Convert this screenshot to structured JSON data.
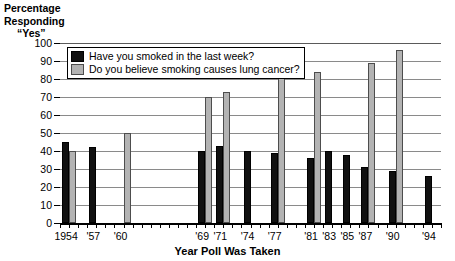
{
  "chart_data": {
    "type": "bar",
    "title": "",
    "ylabel": "Percentage Responding \"Yes\"",
    "ylabel_lines": [
      "Percentage",
      "Responding",
      "“Yes”"
    ],
    "xlabel": "Year Poll Was Taken",
    "ylim": [
      0,
      100
    ],
    "ytick_labels": [
      "0",
      "10",
      "20",
      "30",
      "40",
      "50",
      "60",
      "70",
      "80",
      "90",
      "100"
    ],
    "ytick_values": [
      0,
      10,
      20,
      30,
      40,
      50,
      60,
      70,
      80,
      90,
      100
    ],
    "grid": true,
    "legend_position": "top-left-inside",
    "x_range": [
      1953,
      1995
    ],
    "xtick_years": [
      1953,
      1954,
      1955,
      1956,
      1957,
      1958,
      1959,
      1960,
      1961,
      1962,
      1963,
      1964,
      1965,
      1966,
      1967,
      1968,
      1969,
      1970,
      1971,
      1972,
      1973,
      1974,
      1975,
      1976,
      1977,
      1978,
      1979,
      1980,
      1981,
      1982,
      1983,
      1984,
      1985,
      1986,
      1987,
      1988,
      1989,
      1990,
      1991,
      1992,
      1993,
      1994,
      1995
    ],
    "categories": [
      1954,
      1957,
      1960,
      1969,
      1971,
      1974,
      1977,
      1981,
      1983,
      1985,
      1987,
      1990,
      1994
    ],
    "xtick_labels": [
      {
        "year": 1954,
        "label": "1954"
      },
      {
        "year": 1957,
        "label": "'57"
      },
      {
        "year": 1960,
        "label": "'60"
      },
      {
        "year": 1969,
        "label": "'69"
      },
      {
        "year": 1971,
        "label": "'71"
      },
      {
        "year": 1974,
        "label": "'74"
      },
      {
        "year": 1977,
        "label": "'77"
      },
      {
        "year": 1981,
        "label": "'81"
      },
      {
        "year": 1983,
        "label": "'83"
      },
      {
        "year": 1985,
        "label": "'85"
      },
      {
        "year": 1987,
        "label": "'87"
      },
      {
        "year": 1990,
        "label": "'90"
      },
      {
        "year": 1994,
        "label": "'94"
      }
    ],
    "series": [
      {
        "name": "Have you smoked in the last week?",
        "color": "#111111",
        "points": [
          {
            "year": 1954,
            "value": 45
          },
          {
            "year": 1957,
            "value": 42
          },
          {
            "year": 1960,
            "value": null
          },
          {
            "year": 1969,
            "value": 40
          },
          {
            "year": 1971,
            "value": 43
          },
          {
            "year": 1974,
            "value": 40
          },
          {
            "year": 1977,
            "value": 39
          },
          {
            "year": 1981,
            "value": 36
          },
          {
            "year": 1983,
            "value": 40
          },
          {
            "year": 1985,
            "value": 38
          },
          {
            "year": 1987,
            "value": 31
          },
          {
            "year": 1990,
            "value": 29
          },
          {
            "year": 1994,
            "value": 26
          }
        ]
      },
      {
        "name": "Do you believe smoking causes lung cancer?",
        "color": "#b3b3b3",
        "points": [
          {
            "year": 1954,
            "value": 40
          },
          {
            "year": 1957,
            "value": null
          },
          {
            "year": 1960,
            "value": 50
          },
          {
            "year": 1969,
            "value": 70
          },
          {
            "year": 1971,
            "value": 73
          },
          {
            "year": 1974,
            "value": null
          },
          {
            "year": 1977,
            "value": 82
          },
          {
            "year": 1981,
            "value": 84
          },
          {
            "year": 1983,
            "value": null
          },
          {
            "year": 1985,
            "value": null
          },
          {
            "year": 1987,
            "value": 89
          },
          {
            "year": 1990,
            "value": 96
          },
          {
            "year": 1994,
            "value": null
          }
        ]
      }
    ]
  }
}
